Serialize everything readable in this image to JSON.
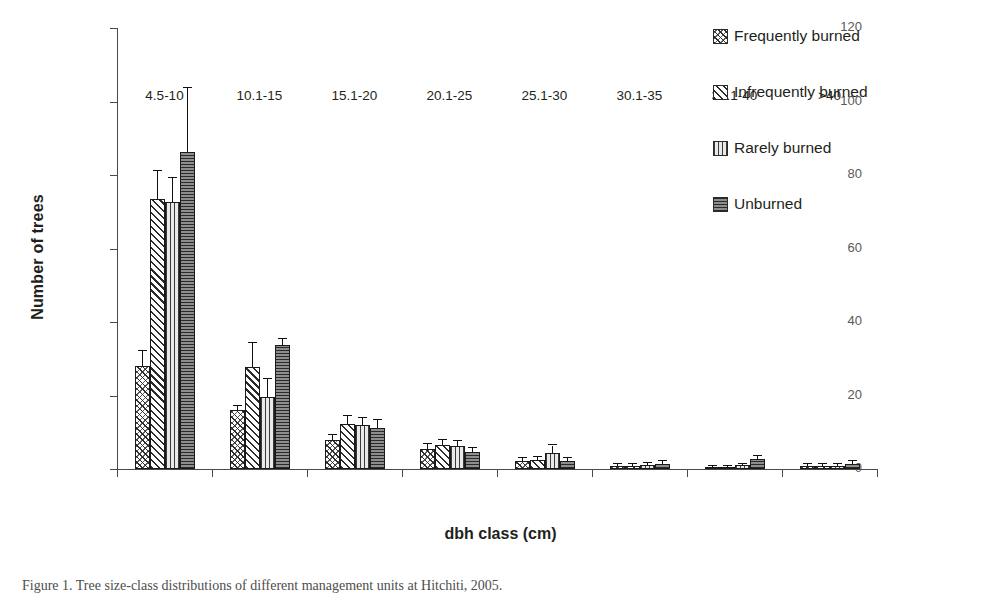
{
  "chart_data": {
    "type": "bar",
    "title": "",
    "xlabel": "dbh class (cm)",
    "ylabel": "Number of trees",
    "ylim": [
      0,
      120
    ],
    "yticks": [
      0,
      20,
      40,
      60,
      80,
      100,
      120
    ],
    "grid": false,
    "legend_position": "right",
    "categories": [
      "4.5-10",
      "10.1-15",
      "15.1-20",
      "20.1-25",
      "25.1-30",
      "30.1-35",
      "35.1-40",
      ">40"
    ],
    "series": [
      {
        "name": "Frequently burned",
        "pattern": "cross-hatch",
        "values": [
          28.0,
          16.0,
          7.8,
          5.4,
          2.2,
          0.8,
          0.3,
          0.8
        ],
        "errors": [
          4.0,
          1.2,
          1.5,
          1.3,
          0.9,
          0.5,
          0.3,
          0.6
        ]
      },
      {
        "name": "Infrequently burned",
        "pattern": "diagonal-lines",
        "values": [
          73.5,
          27.8,
          12.2,
          6.6,
          2.4,
          0.9,
          0.5,
          0.8
        ],
        "errors": [
          7.5,
          6.5,
          2.2,
          1.4,
          1.0,
          0.6,
          0.4,
          0.5
        ]
      },
      {
        "name": "Rarely burned",
        "pattern": "vertical-lines",
        "values": [
          72.7,
          19.6,
          11.9,
          6.3,
          4.3,
          1.0,
          1.0,
          0.9
        ],
        "errors": [
          6.5,
          5.0,
          1.9,
          1.3,
          2.1,
          0.6,
          0.5,
          0.5
        ]
      },
      {
        "name": "Unburned",
        "pattern": "horizontal-lines",
        "values": [
          86.3,
          33.7,
          11.2,
          4.6,
          2.1,
          1.4,
          2.7,
          1.5
        ]
      }
    ],
    "unburned_errors": [
      17.5,
      1.8,
      2.1,
      1.2,
      0.8,
      0.8,
      0.8,
      0.7
    ]
  },
  "axes": {
    "y_title": "Number of trees",
    "x_title": "dbh class (cm)",
    "y_tick_labels": [
      "0",
      "20",
      "40",
      "60",
      "80",
      "100",
      "120"
    ],
    "x_tick_labels": [
      "4.5-10",
      "10.1-15",
      "15.1-20",
      "20.1-25",
      "25.1-30",
      "30.1-35",
      "35.1-40",
      ">40"
    ]
  },
  "legend": {
    "items": [
      {
        "label": "Frequently burned"
      },
      {
        "label": "Infrequently burned"
      },
      {
        "label": "Rarely burned"
      },
      {
        "label": "Unburned"
      }
    ]
  },
  "caption": {
    "text": "Figure 1. Tree size-class distributions of different management units at Hitchiti, 2005."
  },
  "colors": {
    "axis": "#4a4a4a",
    "text": "#231f20",
    "tick_text": "#58595b",
    "bar_outline": "#1a1a1a",
    "unburned_fill": "#8d8d8d",
    "rarely_fill": "#e9e9e9"
  }
}
